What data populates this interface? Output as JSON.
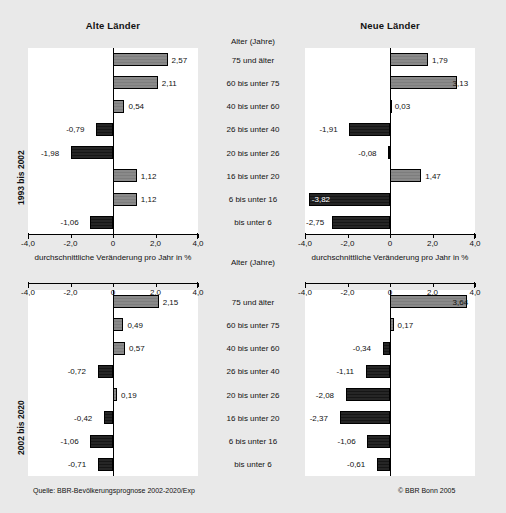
{
  "figure": {
    "titles": {
      "left": "Alte Länder",
      "right": "Neue Länder"
    },
    "age_header": "Alter (Jahre)",
    "axis_caption": "durchschnittliche Veränderung pro Jahr in %",
    "row_labels": {
      "top": "1993 bis 2002",
      "bottom": "2002 bis 2020"
    },
    "source": "Quelle: BBR-Bevölkerungsprognose 2002-2020/Exp",
    "copyright": "© BBR Bonn 2005",
    "colors": {
      "background": "#e9e9e9",
      "panel": "#ffffff",
      "positive_bar": "#8a8a8a",
      "negative_bar": "#262626",
      "axis": "#000000",
      "text": "#111111"
    }
  },
  "chart_data": [
    {
      "type": "bar",
      "title": "Alte Länder 1993 bis 2002",
      "orientation": "horizontal",
      "panel": "top-left",
      "xlabel": "durchschnittliche Veränderung pro Jahr in %",
      "ylabel": "Alter (Jahre)",
      "xlim": [
        -4.0,
        4.0
      ],
      "xticks": [
        -4.0,
        -2.0,
        0,
        2.0,
        4.0
      ],
      "xticklabels": [
        "-4,0",
        "-2,0",
        "0",
        "2,0",
        "4,0"
      ],
      "grid": false,
      "legend": false,
      "categories": [
        "75 und älter",
        "60 bis unter 75",
        "40 bis unter 60",
        "26 bis unter 40",
        "20 bis unter 26",
        "16 bis unter 20",
        "6 bis unter 16",
        "bis unter  6"
      ],
      "values": [
        2.57,
        2.11,
        0.54,
        -0.79,
        -1.98,
        1.12,
        1.12,
        -1.06
      ],
      "value_labels": [
        "2,57",
        "2,11",
        "0,54",
        "-0,79",
        "-1,98",
        "1,12",
        "1,12",
        "-1,06"
      ]
    },
    {
      "type": "bar",
      "title": "Neue Länder 1993 bis 2002",
      "orientation": "horizontal",
      "panel": "top-right",
      "xlabel": "durchschnittliche Veränderung pro Jahr in %",
      "ylabel": "Alter (Jahre)",
      "xlim": [
        -4.0,
        4.0
      ],
      "xticks": [
        -4.0,
        -2.0,
        0,
        2.0,
        4.0
      ],
      "xticklabels": [
        "-4,0",
        "-2,0",
        "0",
        "2,0",
        "4,0"
      ],
      "grid": false,
      "legend": false,
      "categories": [
        "75 und älter",
        "60 bis unter 75",
        "40 bis unter 60",
        "26 bis unter 40",
        "20 bis unter 26",
        "16 bis unter 20",
        "6 bis unter 16",
        "bis unter  6"
      ],
      "values": [
        1.79,
        3.13,
        0.03,
        -1.91,
        -0.08,
        1.47,
        -3.82,
        -2.75
      ],
      "value_labels": [
        "1,79",
        "3,13",
        "0,03",
        "-1,91",
        "-0,08",
        "1,47",
        "-3,82",
        "-2,75"
      ]
    },
    {
      "type": "bar",
      "title": "Alte Länder 2002 bis 2020",
      "orientation": "horizontal",
      "panel": "bottom-left",
      "xlabel": "durchschnittliche Veränderung pro Jahr in %",
      "ylabel": "Alter (Jahre)",
      "xlim": [
        -4.0,
        4.0
      ],
      "xticks": [
        -4.0,
        -2.0,
        0,
        2.0,
        4.0
      ],
      "xticklabels": [
        "-4,0",
        "-2,0",
        "0",
        "2,0",
        "4,0"
      ],
      "grid": false,
      "legend": false,
      "categories": [
        "75 und älter",
        "60 bis unter 75",
        "40 bis unter 60",
        "26 bis unter 40",
        "20 bis unter 26",
        "16 bis unter 20",
        "6 bis unter 16",
        "bis unter  6"
      ],
      "values": [
        2.15,
        0.49,
        0.57,
        -0.72,
        0.19,
        -0.42,
        -1.06,
        -0.71
      ],
      "value_labels": [
        "2,15",
        "0,49",
        "0,57",
        "-0,72",
        "0,19",
        "-0,42",
        "-1,06",
        "-0,71"
      ]
    },
    {
      "type": "bar",
      "title": "Neue Länder 2002 bis 2020",
      "orientation": "horizontal",
      "panel": "bottom-right",
      "xlabel": "durchschnittliche Veränderung pro Jahr in %",
      "ylabel": "Alter (Jahre)",
      "xlim": [
        -4.0,
        4.0
      ],
      "xticks": [
        -4.0,
        -2.0,
        0,
        2.0,
        4.0
      ],
      "xticklabels": [
        "-4,0",
        "-2,0",
        "0",
        "2,0",
        "4,0"
      ],
      "grid": false,
      "legend": false,
      "categories": [
        "75 und älter",
        "60 bis unter 75",
        "40 bis unter 60",
        "26 bis unter 40",
        "20 bis unter 26",
        "16 bis unter 20",
        "6 bis unter 16",
        "bis unter  6"
      ],
      "values": [
        3.64,
        0.17,
        -0.34,
        -1.11,
        -2.08,
        -2.37,
        -1.06,
        -0.61
      ],
      "value_labels": [
        "3,64",
        "0,17",
        "-0,34",
        "-1,11",
        "-2,08",
        "-2,37",
        "-1,06",
        "-0,61"
      ]
    }
  ]
}
